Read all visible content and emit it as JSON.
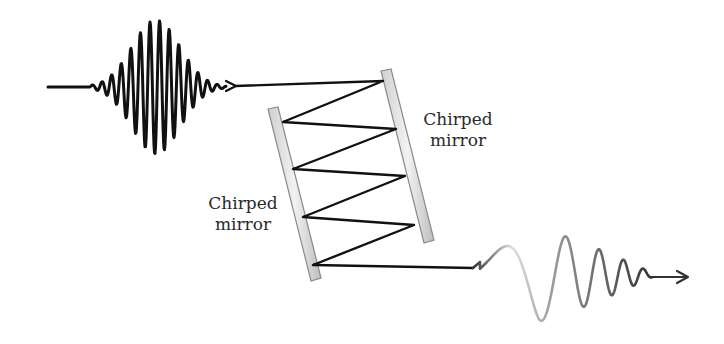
{
  "diagram": {
    "title": "",
    "labels": {
      "right_mirror": {
        "line1": "Chirped",
        "line2": "mirror"
      },
      "left_mirror": {
        "line1": "Chirped",
        "line2": "mirror"
      }
    },
    "elements": [
      {
        "id": "input-pulse",
        "type": "transform-limited pulse",
        "direction": "right"
      },
      {
        "id": "right-mirror",
        "type": "chirped mirror"
      },
      {
        "id": "left-mirror",
        "type": "chirped mirror"
      },
      {
        "id": "beam-path",
        "type": "zigzag reflections",
        "bounces_right_mirror": 4,
        "bounces_left_mirror": 4
      },
      {
        "id": "output-pulse",
        "type": "chirped pulse",
        "direction": "right"
      }
    ],
    "colors": {
      "beam": "#111111",
      "mirror_fill": "#e4e4e4",
      "mirror_edge": "#8a8a8a",
      "text": "#2a2a2a"
    }
  }
}
